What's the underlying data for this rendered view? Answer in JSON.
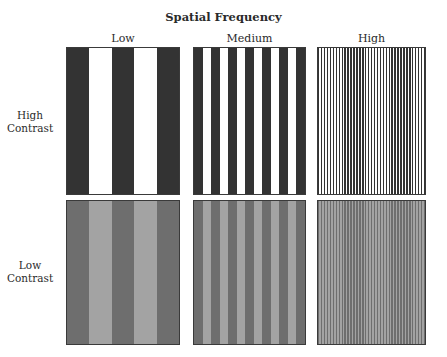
{
  "title": "Spatial Frequency",
  "columns": [
    {
      "label": "Low",
      "stripes": 5
    },
    {
      "label": "Medium",
      "stripes": 13
    },
    {
      "label": "High",
      "stripes": 73
    }
  ],
  "rows": [
    {
      "label_line1": "High",
      "label_line2": "Contrast",
      "dark_color": "#333333",
      "light_color": "#ffffff"
    },
    {
      "label_line1": "Low",
      "label_line2": "Contrast",
      "dark_color": "#6e6e6e",
      "light_color": "#a3a3a3"
    }
  ],
  "colors": {
    "border": "#3a3a3a",
    "background": "#ffffff"
  }
}
